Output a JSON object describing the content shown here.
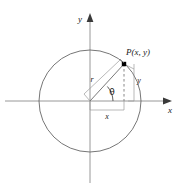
{
  "figure": {
    "type": "unit-circle-trig-diagram",
    "axes": {
      "x_label": "x",
      "y_label": "y"
    },
    "labels": {
      "point": "P(x, y)",
      "radius": "r",
      "angle": "θ",
      "horizontal_leg": "x",
      "vertical_leg": "y"
    },
    "colors": {
      "stroke": "#555555",
      "axis": "#888888",
      "text": "#1a1a1a",
      "point_fill": "#000000",
      "background": "#ffffff"
    },
    "geometry": {
      "origin_x": 90,
      "origin_y": 101,
      "circle_radius": 51,
      "point_x": 124,
      "point_y": 64
    }
  }
}
